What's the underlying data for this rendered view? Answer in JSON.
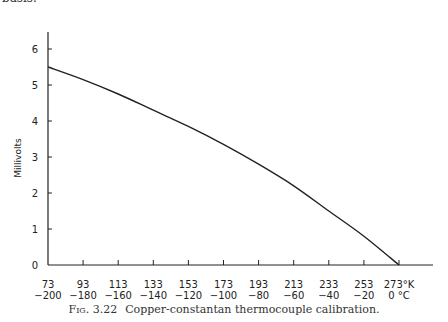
{
  "page": {
    "top_text": "basis."
  },
  "caption": {
    "fig_label": "Fig. 3.22",
    "text": "Copper-constantan thermocouple calibration."
  },
  "chart_data": {
    "type": "line",
    "title": "Copper-constantan thermocouple calibration",
    "xlabel": "Temperature (°K / °C)",
    "ylabel": "Millivolts",
    "x_kelvin": [
      73,
      93,
      113,
      133,
      153,
      173,
      193,
      213,
      233,
      253,
      273
    ],
    "x_celsius": [
      -200,
      -180,
      -160,
      -140,
      -120,
      -100,
      -80,
      -60,
      -40,
      -20,
      0
    ],
    "x_tick_labels_k": [
      "73",
      "93",
      "113",
      "133",
      "153",
      "173",
      "193",
      "213",
      "233",
      "253",
      "273°K"
    ],
    "x_tick_labels_c": [
      "−200",
      "−180",
      "−160",
      "−140",
      "−120",
      "−100",
      "−80",
      "−60",
      "−40",
      "−20",
      "0 °C"
    ],
    "y_ticks": [
      0,
      1,
      2,
      3,
      4,
      5,
      6
    ],
    "ylim": [
      0,
      7
    ],
    "series": [
      {
        "name": "Copper-constantan",
        "values": [
          5.5,
          5.15,
          4.75,
          4.3,
          3.85,
          3.35,
          2.8,
          2.2,
          1.5,
          0.8,
          0.0
        ]
      }
    ],
    "grid": false,
    "legend": "none"
  }
}
